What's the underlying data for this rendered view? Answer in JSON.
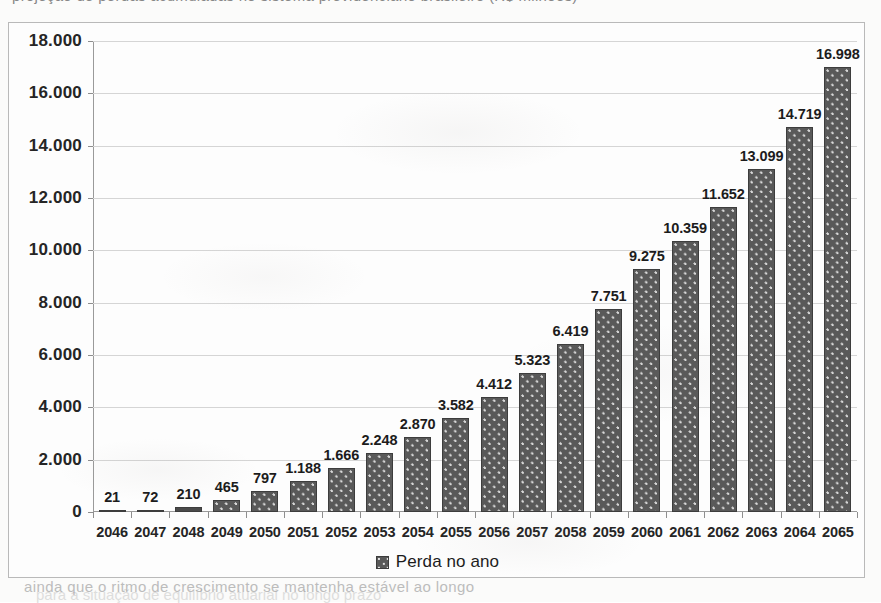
{
  "page": {
    "bleed_top_text": "projeção de perdas acumuladas no sistema previdenciário brasileiro (R$ milhões)",
    "bleed_bottom_text": "ainda que o ritmo de crescimento se mantenha estável ao longo",
    "ghost_line_text": "para a situação de equilíbrio atuarial no longo prazo"
  },
  "chart_data": {
    "type": "bar",
    "title": "",
    "subtitle": "",
    "xlabel": "",
    "ylabel": "",
    "categories": [
      "2046",
      "2047",
      "2048",
      "2049",
      "2050",
      "2051",
      "2052",
      "2053",
      "2054",
      "2055",
      "2056",
      "2057",
      "2058",
      "2059",
      "2060",
      "2061",
      "2062",
      "2063",
      "2064",
      "2065"
    ],
    "values": [
      21,
      72,
      210,
      465,
      797,
      1188,
      1666,
      2248,
      2870,
      3582,
      4412,
      5323,
      6419,
      7751,
      9275,
      10359,
      11652,
      13099,
      14719,
      16998
    ],
    "value_labels": [
      "21",
      "72",
      "210",
      "465",
      "797",
      "1.188",
      "1.666",
      "2.248",
      "2.870",
      "3.582",
      "4.412",
      "5.323",
      "6.419",
      "7.751",
      "9.275",
      "10.359",
      "11.652",
      "13.099",
      "14.719",
      "16.998"
    ],
    "series": [
      {
        "name": "Perda no ano",
        "values": [
          21,
          72,
          210,
          465,
          797,
          1188,
          1666,
          2248,
          2870,
          3582,
          4412,
          5323,
          6419,
          7751,
          9275,
          10359,
          11652,
          13099,
          14719,
          16998
        ]
      }
    ],
    "ylim": [
      0,
      18000
    ],
    "ytick_values": [
      0,
      2000,
      4000,
      6000,
      8000,
      10000,
      12000,
      14000,
      16000,
      18000
    ],
    "ytick_labels": [
      "0",
      "2.000",
      "4.000",
      "6.000",
      "8.000",
      "10.000",
      "12.000",
      "14.000",
      "16.000",
      "18.000"
    ],
    "grid": true,
    "legend": {
      "position": "bottom",
      "entries": [
        {
          "label": "Perda no ano",
          "marker": "patterned-square-marker",
          "color": "#595959"
        }
      ]
    },
    "colors": {
      "bar_fill": "#595959",
      "bar_pattern": "#d9d9d9",
      "bar_border": "#3d3d3d",
      "gridline": "#d5d5d5",
      "axis": "#9a9a9a",
      "frame_border": "#b9b9b9",
      "text": "#1c1c1c",
      "background": "#fbfbfa"
    }
  }
}
